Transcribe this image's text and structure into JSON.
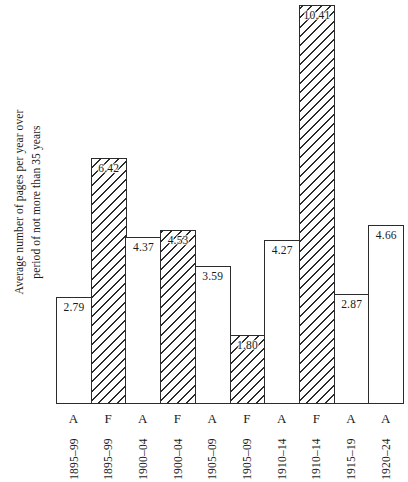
{
  "chart_data": {
    "type": "bar",
    "title": "",
    "xlabel": "",
    "ylabel": "Average number of pages per year over period of not more than 35 years",
    "ylabel_line1": "Average number of pages per year over",
    "ylabel_line2": "period of not more than 35 years",
    "ylim": [
      0,
      10.41
    ],
    "grid": false,
    "legend": "none",
    "categories": [
      "A 1895–99",
      "F 1895–99",
      "A 1900–04",
      "F 1900–04",
      "A 1905–09",
      "F 1905–09",
      "A 1910–14",
      "F 1910–14",
      "A 1915–19",
      "A 1920–24"
    ],
    "values": [
      2.79,
      6.42,
      4.37,
      4.53,
      3.59,
      1.8,
      4.27,
      10.41,
      2.87,
      4.66
    ],
    "bars": [
      {
        "letter": "A",
        "period": "1895–99",
        "value": 2.79,
        "label": "2.79",
        "fill": "plain"
      },
      {
        "letter": "F",
        "period": "1895–99",
        "value": 6.42,
        "label": "6.42",
        "fill": "hatched"
      },
      {
        "letter": "A",
        "period": "1900–04",
        "value": 4.37,
        "label": "4.37",
        "fill": "plain"
      },
      {
        "letter": "F",
        "period": "1900–04",
        "value": 4.53,
        "label": "4.53",
        "fill": "hatched"
      },
      {
        "letter": "A",
        "period": "1905–09",
        "value": 3.59,
        "label": "3.59",
        "fill": "plain"
      },
      {
        "letter": "F",
        "period": "1905–09",
        "value": 1.8,
        "label": "1.80",
        "fill": "hatched"
      },
      {
        "letter": "A",
        "period": "1910–14",
        "value": 4.27,
        "label": "4.27",
        "fill": "plain"
      },
      {
        "letter": "F",
        "period": "1910–14",
        "value": 10.41,
        "label": "10.41",
        "fill": "hatched"
      },
      {
        "letter": "A",
        "period": "1915–19",
        "value": 2.87,
        "label": "2.87",
        "fill": "plain"
      },
      {
        "letter": "A",
        "period": "1920–24",
        "value": 4.66,
        "label": "4.66",
        "fill": "plain"
      }
    ],
    "colors": {
      "ink": "#2b2b2b",
      "background": "#ffffff"
    }
  }
}
